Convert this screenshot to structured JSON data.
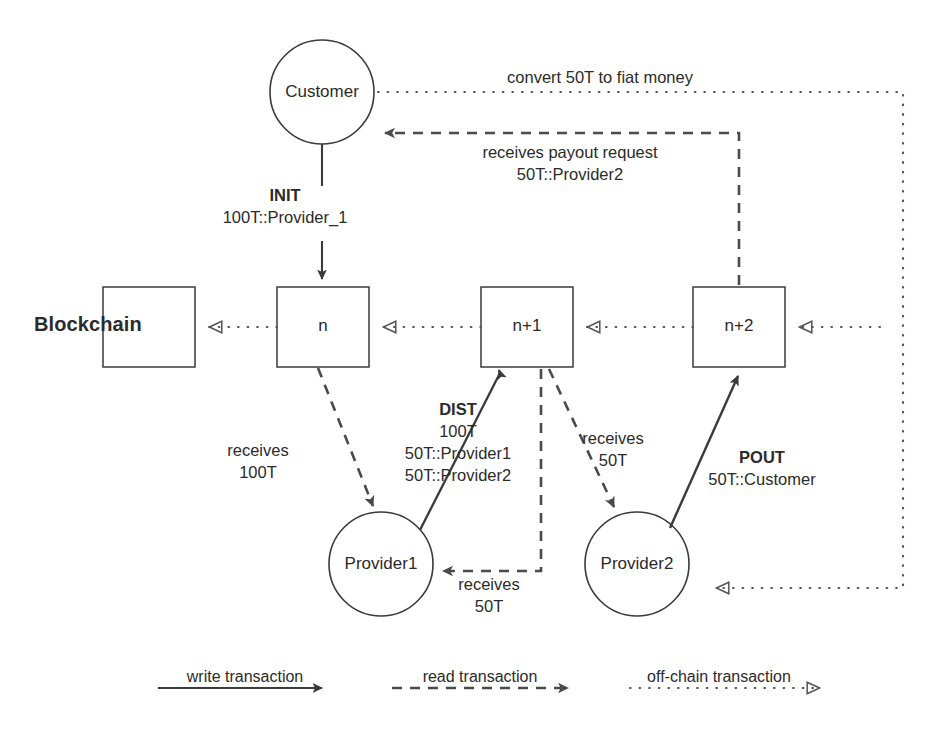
{
  "diagram": {
    "nodes": {
      "customer": "Customer",
      "provider1": "Provider1",
      "provider2": "Provider2"
    },
    "chain_label": "Blockchain",
    "blocks": [
      "",
      "n",
      "n+1",
      "n+2"
    ],
    "edges": {
      "init_name": "INIT",
      "init_detail": "100T::Provider_1",
      "dist_name": "DIST",
      "dist_detail_1": "100T",
      "dist_detail_2": "50T::Provider1",
      "dist_detail_3": "50T::Provider2",
      "pout_name": "POUT",
      "pout_detail": "50T::Customer",
      "convert": "convert 50T to fiat money",
      "payout_request_1": "receives payout request",
      "payout_request_2": "50T::Provider2",
      "receives_100t_1": "receives",
      "receives_100t_2": "100T",
      "receives_50t_p1_1": "receives",
      "receives_50t_p1_2": "50T",
      "receives_50t_p2_1": "receives",
      "receives_50t_p2_2": "50T"
    },
    "legend": [
      {
        "key": "write",
        "label": "write transaction",
        "style": "solid"
      },
      {
        "key": "read",
        "label": "read transaction",
        "style": "dashed"
      },
      {
        "key": "offchain",
        "label": "off-chain transaction",
        "style": "dotted"
      }
    ],
    "colors": {
      "ink": "#2b2b2b",
      "stroke": "#3a3a3a",
      "dotted": "#555555",
      "background": "#ffffff"
    }
  }
}
